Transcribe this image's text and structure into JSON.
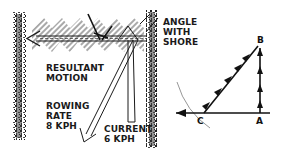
{
  "diagram": {
    "type": "vector-diagram",
    "left_panel": {
      "labels": {
        "resultant_line1": "RESULTANT",
        "resultant_line2": "MOTION",
        "rowing_line1": "ROWING",
        "rowing_line2": "RATE",
        "rowing_line3": "8 KPH",
        "current_line1": "CURRENT",
        "current_line2": "6 KPH",
        "angle_line1": "ANGLE",
        "angle_line2": "WITH",
        "angle_line3": "SHORE"
      },
      "vectors": [
        {
          "name": "resultant motion",
          "direction": "left"
        },
        {
          "name": "rowing rate",
          "value": "8 KPH"
        },
        {
          "name": "current",
          "value": "6 KPH"
        }
      ]
    },
    "right_panel": {
      "points": {
        "a": "A",
        "b": "B",
        "c": "C"
      },
      "segments": [
        "A→B (vertical)",
        "B→C (diagonal)",
        "A→C (horizontal)"
      ],
      "arc": "through C"
    },
    "colors": {
      "ink": "#1a1a1a",
      "hatch": "#9a9a9a",
      "shore": "#2b2b2b",
      "background": "#ffffff"
    }
  }
}
